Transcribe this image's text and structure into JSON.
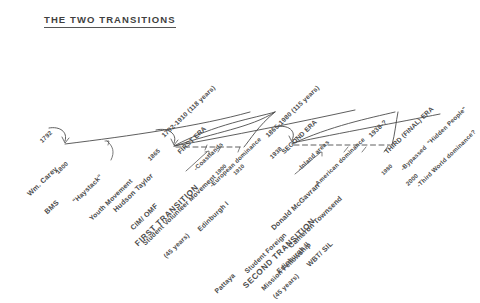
{
  "document": {
    "title": "THE TWO TRANSITIONS",
    "type": "hand-drawn historical timeline diagram",
    "background_color": "#ffffff",
    "ink_color": "#4c4c4c"
  },
  "eras": [
    {
      "id": "first-era",
      "range": "1792-1910 (118 years)",
      "name": "FIRST ERA",
      "bullets": [
        "-Coastlands",
        "-European dominance"
      ]
    },
    {
      "id": "second-era",
      "range": "1865-1980 (115 years)",
      "name": "SECOND ERA",
      "bullets": [
        "-Inland areas",
        "-American dominance"
      ]
    },
    {
      "id": "third-era",
      "range": "1938-?",
      "name": "THIRD (FINAL) ERA",
      "bullets": [
        "-Bypassed  \"Hidden People\"",
        "-Third World dominance?"
      ]
    }
  ],
  "transitions": [
    {
      "id": "first-transition",
      "name": "FIRST TRANSITION",
      "duration": "(45 years)"
    },
    {
      "id": "second-transition",
      "name": "SECOND TRANSITION",
      "duration": "(45 years)"
    }
  ],
  "people": [
    {
      "id": "william-carey",
      "name": "Wm. Carey",
      "org": "BMS"
    },
    {
      "id": "hudson-taylor",
      "name": "Hudson Taylor",
      "org": "CIM/ OMF"
    },
    {
      "id": "mcgavran-townsend",
      "name": "Donald McGavran",
      "name2": "Cameron Townsend",
      "org": "WBT/ SIL"
    }
  ],
  "movements": [
    {
      "id": "haystack",
      "label": "\"Haystack\"",
      "label2": "Youth Movement"
    },
    {
      "id": "student-volunteer",
      "label": "Student Volunteer Movement"
    },
    {
      "id": "sfmf",
      "label": "Student Foreign",
      "label2": "Mission Fellowship"
    }
  ],
  "conferences": [
    {
      "id": "edinburgh-1",
      "label": "Edinburgh I"
    },
    {
      "id": "edinburgh-2",
      "label": "Edinburgh II"
    },
    {
      "id": "pattaya",
      "label": "Pattaya"
    }
  ],
  "dates": [
    {
      "id": "date-1792",
      "label": "1792"
    },
    {
      "id": "date-1800",
      "label": "1800"
    },
    {
      "id": "date-1865",
      "label": "1865"
    },
    {
      "id": "date-1900",
      "label": "1900"
    },
    {
      "id": "date-1910",
      "label": "1910"
    },
    {
      "id": "date-1938",
      "label": "1938"
    },
    {
      "id": "date-1980",
      "label": "1980"
    },
    {
      "id": "date-2000",
      "label": "2000"
    }
  ]
}
